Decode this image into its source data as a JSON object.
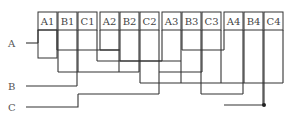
{
  "diagram": {
    "terminals": [
      {
        "label": "A1",
        "x": 38
      },
      {
        "label": "B1",
        "x": 58
      },
      {
        "label": "C1",
        "x": 78
      },
      {
        "label": "A2",
        "x": 100
      },
      {
        "label": "B2",
        "x": 120
      },
      {
        "label": "C2",
        "x": 140
      },
      {
        "label": "A3",
        "x": 162
      },
      {
        "label": "B3",
        "x": 182
      },
      {
        "label": "C3",
        "x": 202
      },
      {
        "label": "A4",
        "x": 224
      },
      {
        "label": "B4",
        "x": 244
      },
      {
        "label": "C4",
        "x": 264
      }
    ],
    "inputs": [
      {
        "label": "A",
        "y": 43
      },
      {
        "label": "B",
        "y": 86
      },
      {
        "label": "C",
        "y": 107
      }
    ],
    "junction_dot": {
      "x": 265,
      "y": 105
    }
  }
}
